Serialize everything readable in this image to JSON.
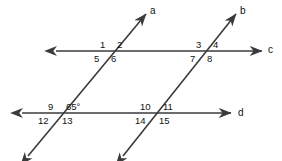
{
  "figure": {
    "stroke_color": "#3b3b3b",
    "text_color": "#111111",
    "background": "#ffffff",
    "stroke_width": 1.6
  },
  "lines": [
    {
      "id": "a",
      "label": "a",
      "kind": "transversal",
      "label_x": 150,
      "label_y": 6,
      "x1": 28,
      "y1": 156,
      "x2": 146,
      "y2": 14,
      "arrow_start": true,
      "arrow_end": true
    },
    {
      "id": "b",
      "label": "b",
      "kind": "transversal",
      "label_x": 240,
      "label_y": 6,
      "x1": 123,
      "y1": 156,
      "x2": 236,
      "y2": 14,
      "arrow_start": true,
      "arrow_end": true
    },
    {
      "id": "c",
      "label": "c",
      "kind": "horizontal",
      "label_x": 268,
      "label_y": 45,
      "x1": 56,
      "y1": 51,
      "x2": 262,
      "y2": 51,
      "arrow_start": true,
      "arrow_end": true
    },
    {
      "id": "d",
      "label": "d",
      "kind": "horizontal",
      "label_x": 238,
      "label_y": 108,
      "x1": 22,
      "y1": 113,
      "x2": 231,
      "y2": 113,
      "arrow_start": true,
      "arrow_end": true
    }
  ],
  "intersections": [
    {
      "id": "a-c",
      "name": "intersection-a-c",
      "x": 112,
      "y": 51,
      "angles": [
        {
          "label": "1",
          "x": 100,
          "y": 40
        },
        {
          "label": "2",
          "x": 117,
          "y": 40
        },
        {
          "label": "5",
          "x": 94,
          "y": 54
        },
        {
          "label": "6",
          "x": 111,
          "y": 54
        }
      ]
    },
    {
      "id": "b-c",
      "name": "intersection-b-c",
      "x": 208,
      "y": 51,
      "angles": [
        {
          "label": "3",
          "x": 196,
          "y": 40
        },
        {
          "label": "4",
          "x": 213,
          "y": 40
        },
        {
          "label": "7",
          "x": 190,
          "y": 54
        },
        {
          "label": "8",
          "x": 207,
          "y": 54
        }
      ]
    },
    {
      "id": "a-d",
      "name": "intersection-a-d",
      "x": 60,
      "y": 113,
      "angles": [
        {
          "label": "9",
          "x": 48,
          "y": 102
        },
        {
          "label": "12",
          "x": 38,
          "y": 116
        },
        {
          "label": "13",
          "x": 62,
          "y": 116
        }
      ]
    },
    {
      "id": "b-d",
      "name": "intersection-b-d",
      "x": 157,
      "y": 113,
      "angles": [
        {
          "label": "10",
          "x": 140,
          "y": 102
        },
        {
          "label": "11",
          "x": 163,
          "y": 102
        },
        {
          "label": "14",
          "x": 135,
          "y": 116
        },
        {
          "label": "15",
          "x": 159,
          "y": 116
        }
      ]
    }
  ],
  "measures": [
    {
      "id": "angle-65",
      "name": "angle-measure-65-degrees",
      "text": "65°",
      "x": 66,
      "y": 102
    }
  ]
}
